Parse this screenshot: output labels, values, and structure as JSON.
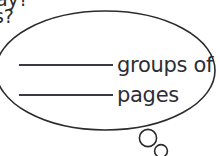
{
  "worksheet": {
    "type": "thought-bubble-fill-in-the-blank",
    "cutoff_question": {
      "line_1": "ay?",
      "line_2": "s?"
    },
    "bubble": {
      "shape": "ellipse",
      "outline_color": "#2b2b2b",
      "fill_color": "#ffffff",
      "stroke_width": "1.6",
      "tail": {
        "type": "thought-circles",
        "circles": [
          {
            "name": "tail-circle-large",
            "cx": 148,
            "cy": 138,
            "r": 8.6
          },
          {
            "name": "tail-circle-small",
            "cx": 161,
            "cy": 151,
            "r": 6.4
          }
        ]
      }
    },
    "answers": [
      {
        "blank": "",
        "label": "groups of"
      },
      {
        "blank": "",
        "label": "pages"
      }
    ],
    "colors": {
      "ink": "#2d2d33",
      "line": "#3a3a42",
      "paper": "#ffffff"
    }
  }
}
